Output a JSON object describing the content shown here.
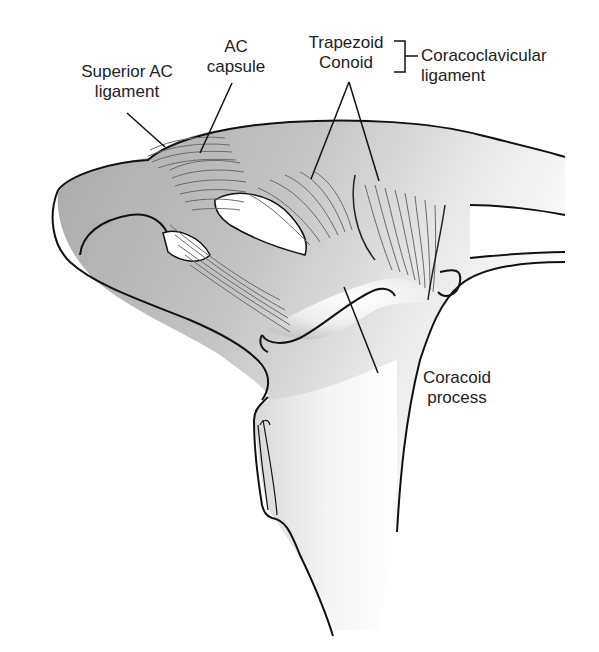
{
  "diagram": {
    "labels": {
      "superior_ac_ligament": [
        "Superior AC",
        "ligament"
      ],
      "ac_capsule": [
        "AC",
        "capsule"
      ],
      "trapezoid": "Trapezoid",
      "conoid": "Conoid",
      "coracoclavicular_ligament": [
        "Coracoclavicular",
        "ligament"
      ],
      "coracoid_process": [
        "Coracoid",
        "process"
      ]
    },
    "colors": {
      "outline": "#111111",
      "bone_fill": "#b9b9b9",
      "bone_light": "#e6e6e6",
      "fiber": "#6a6a6a",
      "text": "#222222"
    }
  }
}
